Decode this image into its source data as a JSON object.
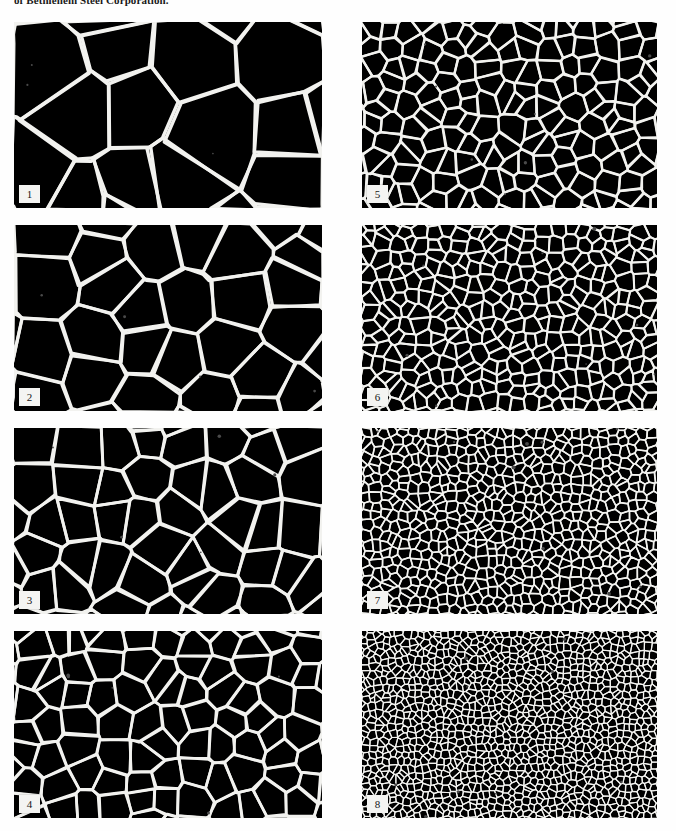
{
  "document": {
    "running_caption": "of Bethlehem Steel Corporation.",
    "page_background": "#ffffff"
  },
  "figure": {
    "type": "grain-size-comparison-plate-grid",
    "columns": 2,
    "rows": 4,
    "ink_color": "#000000",
    "boundary_color": "#f2f2ef",
    "label_box_color": "#f4f4f2",
    "label_text_color": "#161616"
  },
  "plates": [
    {
      "label": "1",
      "column": "left",
      "row": 1,
      "x": 14,
      "y": 22,
      "width": 308,
      "height": 186,
      "cell_count": 11,
      "line_width": 3.4,
      "seed": 101,
      "specks": 3
    },
    {
      "label": "2",
      "column": "left",
      "row": 2,
      "x": 14,
      "y": 225,
      "width": 308,
      "height": 186,
      "cell_count": 22,
      "line_width": 3.1,
      "seed": 202,
      "specks": 4
    },
    {
      "label": "3",
      "column": "left",
      "row": 3,
      "x": 14,
      "y": 428,
      "width": 308,
      "height": 186,
      "cell_count": 40,
      "line_width": 2.9,
      "seed": 303,
      "specks": 5
    },
    {
      "label": "4",
      "column": "left",
      "row": 4,
      "x": 14,
      "y": 631,
      "width": 308,
      "height": 187,
      "cell_count": 72,
      "line_width": 2.7,
      "seed": 404,
      "specks": 5
    },
    {
      "label": "5",
      "column": "right",
      "row": 1,
      "x": 362,
      "y": 22,
      "width": 295,
      "height": 186,
      "cell_count": 150,
      "line_width": 2.3,
      "seed": 505,
      "specks": 7
    },
    {
      "label": "6",
      "column": "right",
      "row": 2,
      "x": 362,
      "y": 225,
      "width": 295,
      "height": 186,
      "cell_count": 300,
      "line_width": 1.9,
      "seed": 606,
      "specks": 8
    },
    {
      "label": "7",
      "column": "right",
      "row": 3,
      "x": 362,
      "y": 428,
      "width": 295,
      "height": 186,
      "cell_count": 620,
      "line_width": 1.5,
      "seed": 707,
      "specks": 9
    },
    {
      "label": "8",
      "column": "right",
      "row": 4,
      "x": 362,
      "y": 631,
      "width": 295,
      "height": 187,
      "cell_count": 1250,
      "line_width": 1.15,
      "seed": 808,
      "specks": 10
    }
  ]
}
